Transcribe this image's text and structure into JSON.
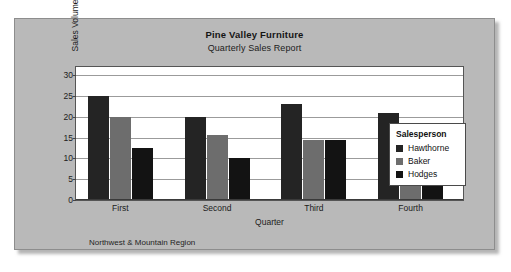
{
  "chart_data": {
    "type": "bar",
    "title": "Pine Valley Furniture",
    "subtitle": "Quarterly Sales Report",
    "xlabel": "Quarter",
    "ylabel": "Sales Volume (0000)",
    "footnote": "Northwest & Mountain Region",
    "categories": [
      "First",
      "Second",
      "Third",
      "Fourth"
    ],
    "series": [
      {
        "name": "Hawthorne",
        "color": "#242424",
        "values": [
          25,
          20,
          23,
          21
        ]
      },
      {
        "name": "Baker",
        "color": "#6d6d6d",
        "values": [
          20,
          15.7,
          14.5,
          13.3
        ]
      },
      {
        "name": "Hodges",
        "color": "#131313",
        "values": [
          12.5,
          10,
          14.5,
          15.2
        ]
      }
    ],
    "ylim": [
      0,
      32
    ],
    "yticks": [
      0,
      5,
      10,
      15,
      20,
      25,
      30
    ],
    "grid": true,
    "legend": {
      "title": "Salesperson",
      "position": "inside-right"
    }
  }
}
